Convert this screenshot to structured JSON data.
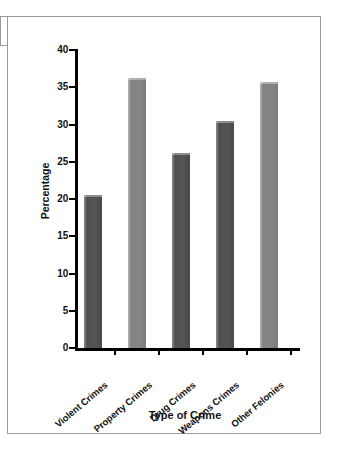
{
  "chart_data": {
    "type": "bar",
    "title": "",
    "xlabel": "Type of Crime",
    "ylabel": "Percentage",
    "categories": [
      "Violent Crimes",
      "Property Crimes",
      "Drug Crimes",
      "Weapons Crimes",
      "Other Felonies"
    ],
    "values": [
      20.5,
      36.3,
      26.2,
      30.5,
      35.7
    ],
    "ylim": [
      0,
      40
    ],
    "yticks": [
      0,
      5,
      10,
      15,
      20,
      25,
      30,
      35,
      40
    ],
    "ytick_labels": [
      "0",
      "5",
      "10",
      "15",
      "20",
      "25",
      "30",
      "35",
      "40"
    ],
    "grid": false,
    "legend": "none",
    "bar_colors": [
      "#555555",
      "#868686",
      "#555555",
      "#555555",
      "#868686"
    ]
  },
  "figure": {
    "background_color": "#ffffff",
    "axis_color": "#000000",
    "border_color": "#9a9a9a"
  }
}
